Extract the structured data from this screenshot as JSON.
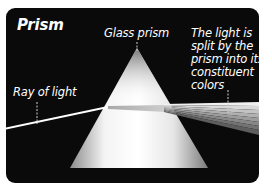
{
  "diagram": {
    "title": "Prism",
    "labels": {
      "glass_prism": "Glass prism",
      "ray_of_light": "Ray of light",
      "caption_lines": [
        "The light is",
        "split by the",
        "prism into its",
        "constituent",
        "colors"
      ]
    },
    "icons": {
      "prism": "triangle-prism-icon",
      "ray": "light-ray-line",
      "spectrum": "dispersed-spectrum-fan"
    },
    "colors": {
      "background": "#0a0a0a",
      "card_margin": "#ffffff",
      "text": "#ffffff",
      "prism_light": "#ffffff",
      "prism_shade": "#9a9a9a",
      "ray": "#ffffff",
      "leader_line": "#cfcfcf"
    }
  }
}
